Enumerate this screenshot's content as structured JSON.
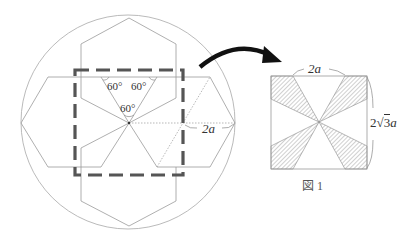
{
  "figure": {
    "caption": "図 1",
    "left_diagram": {
      "angle_labels": [
        "60°",
        "60°",
        "60°"
      ],
      "radius_label": "2a"
    },
    "right_diagram": {
      "width_label": "2a",
      "height_label_prefix": "2",
      "height_label_root": "3",
      "height_label_var": "a"
    }
  },
  "colors": {
    "line": "#9a9a9a",
    "dashed_square": "#555555",
    "arrow": "#111111",
    "hatch": "#888888"
  }
}
